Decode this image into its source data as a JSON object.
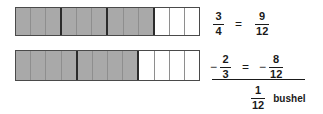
{
  "diagram": {
    "type": "fraction-subtraction-bar-model",
    "bars": [
      {
        "name": "top-bar",
        "label": "3/4 shown as 9 of 12 parts",
        "total_cells": 12,
        "shaded_cells": 9,
        "group_edges": [
          2,
          5,
          8
        ],
        "fraction": "3/4",
        "equivalent": "9/12"
      },
      {
        "name": "bottom-bar",
        "label": "2/3 shown as 8 of 12 parts",
        "total_cells": 12,
        "shaded_cells": 8,
        "group_edges": [
          3,
          7
        ],
        "fraction": "2/3",
        "equivalent": "8/12"
      }
    ],
    "colors": {
      "shaded": "#a9a9a9",
      "unshaded": "#ffffff",
      "outline": "#4a4a4a",
      "divider": "#8e8e8e",
      "group_divider": "#2b2b2b",
      "text": "#1a1a1a"
    }
  },
  "equation": {
    "row1": {
      "minuend": {
        "numerator": "3",
        "denominator": "4"
      },
      "equals": "=",
      "converted": {
        "numerator": "9",
        "denominator": "12"
      }
    },
    "row2": {
      "operator": "−",
      "subtrahend": {
        "numerator": "2",
        "denominator": "3"
      },
      "equals": "=",
      "converted_operator": "−",
      "converted": {
        "numerator": "8",
        "denominator": "12"
      }
    },
    "row3": {
      "result": {
        "numerator": "1",
        "denominator": "12"
      },
      "unit": "bushel"
    }
  }
}
